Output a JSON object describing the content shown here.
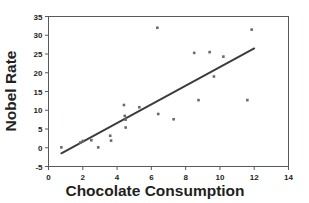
{
  "chart_data": {
    "type": "scatter",
    "title": "",
    "xlabel": "Chocolate Consumption",
    "ylabel": "Nobel Rate",
    "xlim": [
      0,
      14
    ],
    "ylim": [
      -5,
      35
    ],
    "xticks": [
      0,
      2,
      4,
      6,
      8,
      10,
      12,
      14
    ],
    "yticks": [
      -5,
      0,
      5,
      10,
      15,
      20,
      25,
      30,
      35
    ],
    "xtick_labels": [
      "0",
      "2",
      "4",
      "6",
      "8",
      "10",
      "12",
      "14"
    ],
    "ytick_labels": [
      "-5",
      "0",
      "5",
      "10",
      "15",
      "20",
      "25",
      "30",
      "35"
    ],
    "grid": false,
    "legend": false,
    "marker_color": "#6a6a6c",
    "trendline_color": "#3b3b3d",
    "frame_color": "#58595b",
    "text_color": "#231f20",
    "points": [
      {
        "x": 0.75,
        "y": 0.1
      },
      {
        "x": 1.85,
        "y": 1.4
      },
      {
        "x": 2.0,
        "y": 1.8
      },
      {
        "x": 2.5,
        "y": 2.0
      },
      {
        "x": 2.9,
        "y": 0.1
      },
      {
        "x": 3.6,
        "y": 3.2
      },
      {
        "x": 3.65,
        "y": 1.9
      },
      {
        "x": 4.4,
        "y": 11.4
      },
      {
        "x": 4.45,
        "y": 8.5
      },
      {
        "x": 4.5,
        "y": 7.5
      },
      {
        "x": 4.5,
        "y": 5.4
      },
      {
        "x": 5.3,
        "y": 10.8
      },
      {
        "x": 6.35,
        "y": 32.0
      },
      {
        "x": 6.4,
        "y": 9.0
      },
      {
        "x": 7.3,
        "y": 7.6
      },
      {
        "x": 8.5,
        "y": 25.3
      },
      {
        "x": 8.75,
        "y": 12.7
      },
      {
        "x": 9.4,
        "y": 25.5
      },
      {
        "x": 9.65,
        "y": 19.0
      },
      {
        "x": 10.2,
        "y": 24.3
      },
      {
        "x": 11.6,
        "y": 12.7
      },
      {
        "x": 11.85,
        "y": 31.5
      }
    ],
    "trendline": {
      "x0": 0.75,
      "y0": -1.5,
      "x1": 12.0,
      "y1": 26.5
    }
  }
}
